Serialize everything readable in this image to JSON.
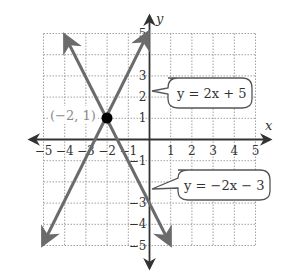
{
  "chart_data": {
    "type": "line",
    "title": "",
    "xlabel": "x",
    "ylabel": "y",
    "xlim": [
      -5,
      5
    ],
    "ylim": [
      -5,
      5
    ],
    "grid": true,
    "x_ticks": [
      "-5",
      "-4",
      "-3",
      "-2",
      "-1",
      "1",
      "2",
      "3",
      "4",
      "5"
    ],
    "y_ticks": [
      "5",
      "3",
      "2",
      "1",
      "-1",
      "-3",
      "-4",
      "-5"
    ],
    "series": [
      {
        "name": "y = 2x + 5",
        "slope": 2,
        "intercept": 5,
        "x": [
          -5,
          0
        ],
        "y": [
          -5,
          5
        ]
      },
      {
        "name": "y = -2x - 3",
        "slope": -2,
        "intercept": -3,
        "x": [
          -4,
          1
        ],
        "y": [
          5,
          -5
        ]
      }
    ],
    "annotations": [
      {
        "text": "(−2, 1)",
        "x": -2,
        "y": 1,
        "type": "point"
      },
      {
        "text": "y = 2x + 5",
        "type": "callout"
      },
      {
        "text": "y = −2x − 3",
        "type": "callout"
      }
    ]
  },
  "axes": {
    "x_label": "x",
    "y_label": "y"
  },
  "ticks": {
    "x": [
      {
        "label": "−5",
        "v": -5
      },
      {
        "label": "−4",
        "v": -4
      },
      {
        "label": "−3",
        "v": -3
      },
      {
        "label": "−2",
        "v": -2
      },
      {
        "label": "−1",
        "v": -1
      },
      {
        "label": "1",
        "v": 1
      },
      {
        "label": "2",
        "v": 2
      },
      {
        "label": "3",
        "v": 3
      },
      {
        "label": "4",
        "v": 4
      },
      {
        "label": "5",
        "v": 5
      }
    ],
    "y": [
      {
        "label": "5",
        "v": 5
      },
      {
        "label": "3",
        "v": 3
      },
      {
        "label": "2",
        "v": 2
      },
      {
        "label": "1",
        "v": 1
      },
      {
        "label": "−1",
        "v": -1
      },
      {
        "label": "−3",
        "v": -3
      },
      {
        "label": "−4",
        "v": -4
      },
      {
        "label": "−5",
        "v": -5
      }
    ]
  },
  "intersection": {
    "label": "(−2, 1)"
  },
  "callouts": {
    "line1": "y = 2x + 5",
    "line2": "y = −2x − 3"
  },
  "colors": {
    "line": "#6b6b6b",
    "axis": "#333333",
    "grid": "#a0a0a0",
    "point": "#000000"
  }
}
